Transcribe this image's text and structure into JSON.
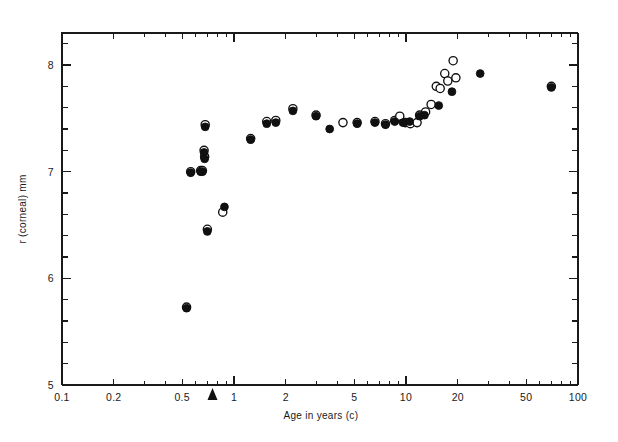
{
  "figure": {
    "background": "#ffffff",
    "foreground": "#101010"
  },
  "axes": {
    "x_title": "Age in years (c)",
    "y_title": "r (corneal) mm",
    "x_tick_labels": [
      "0.1",
      "0.2",
      "0.5",
      "1",
      "2",
      "5",
      "10",
      "20",
      "50",
      "100"
    ],
    "y_tick_labels": [
      "5",
      "6",
      "7",
      "8"
    ]
  },
  "annotations": {
    "birth_marker_label": "",
    "birth_marker_x": 0.75
  },
  "chart_data": {
    "type": "scatter",
    "title": "",
    "xlabel": "Age in years (c)",
    "ylabel": "r (corneal) mm",
    "xscale": "log",
    "yscale": "linear",
    "xlim": [
      0.1,
      100
    ],
    "ylim": [
      5,
      8.3
    ],
    "xticks": [
      0.1,
      0.2,
      0.5,
      1,
      2,
      5,
      10,
      20,
      50,
      100
    ],
    "xticklabels": [
      "0.1",
      "0.2",
      "0.5",
      "1",
      "2",
      "5",
      "10",
      "20",
      "50",
      "100"
    ],
    "yticks": [
      5,
      6,
      7,
      8
    ],
    "yticklabels": [
      "5",
      "6",
      "7",
      "8"
    ],
    "y_minor_tick_step": 0.2,
    "grid": false,
    "legend": "none",
    "annotations": [
      {
        "type": "arrow-up",
        "x": 0.75,
        "y": 5.0,
        "note": "birth / reference age marker on x-axis"
      }
    ],
    "series": [
      {
        "name": "filled",
        "marker": "filled-circle",
        "color": "#101010",
        "points": [
          [
            0.53,
            5.72
          ],
          [
            0.56,
            6.99
          ],
          [
            0.64,
            7.0
          ],
          [
            0.655,
            7.0
          ],
          [
            0.67,
            7.18
          ],
          [
            0.675,
            7.12
          ],
          [
            0.68,
            7.42
          ],
          [
            0.7,
            6.44
          ],
          [
            0.88,
            6.67
          ],
          [
            1.25,
            7.3
          ],
          [
            1.55,
            7.45
          ],
          [
            1.75,
            7.46
          ],
          [
            2.2,
            7.57
          ],
          [
            3.0,
            7.52
          ],
          [
            3.6,
            7.4
          ],
          [
            5.2,
            7.45
          ],
          [
            6.6,
            7.46
          ],
          [
            7.6,
            7.44
          ],
          [
            8.6,
            7.47
          ],
          [
            9.6,
            7.46
          ],
          [
            10.5,
            7.47
          ],
          [
            12.0,
            7.52
          ],
          [
            12.8,
            7.53
          ],
          [
            15.5,
            7.62
          ],
          [
            18.5,
            7.75
          ],
          [
            27.0,
            7.92
          ],
          [
            70.0,
            7.79
          ]
        ]
      },
      {
        "name": "open",
        "marker": "open-circle",
        "color": "#101010",
        "points": [
          [
            0.53,
            5.73
          ],
          [
            0.56,
            7.0
          ],
          [
            0.64,
            7.01
          ],
          [
            0.655,
            7.01
          ],
          [
            0.67,
            7.2
          ],
          [
            0.675,
            7.14
          ],
          [
            0.68,
            7.44
          ],
          [
            0.7,
            6.46
          ],
          [
            0.86,
            6.62
          ],
          [
            1.25,
            7.31
          ],
          [
            1.55,
            7.47
          ],
          [
            1.75,
            7.48
          ],
          [
            2.2,
            7.59
          ],
          [
            3.0,
            7.53
          ],
          [
            4.3,
            7.46
          ],
          [
            5.2,
            7.46
          ],
          [
            6.6,
            7.47
          ],
          [
            7.6,
            7.45
          ],
          [
            8.6,
            7.48
          ],
          [
            9.2,
            7.52
          ],
          [
            9.9,
            7.46
          ],
          [
            10.6,
            7.45
          ],
          [
            11.6,
            7.46
          ],
          [
            12.0,
            7.53
          ],
          [
            13.0,
            7.56
          ],
          [
            14.0,
            7.63
          ],
          [
            15.0,
            7.8
          ],
          [
            15.8,
            7.78
          ],
          [
            16.8,
            7.92
          ],
          [
            17.5,
            7.85
          ],
          [
            18.8,
            8.04
          ],
          [
            19.5,
            7.88
          ],
          [
            70.0,
            7.8
          ]
        ]
      }
    ]
  }
}
